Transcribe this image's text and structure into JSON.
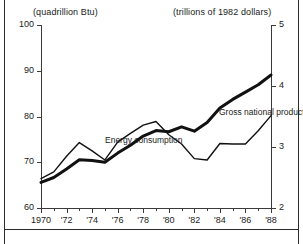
{
  "chart_data": {
    "type": "line",
    "title": "",
    "xlabel": "",
    "grid": false,
    "legend_position": "inline-annotations",
    "x": [
      1970,
      1971,
      1972,
      1973,
      1974,
      1975,
      1976,
      1977,
      1978,
      1979,
      1980,
      1981,
      1982,
      1983,
      1984,
      1985,
      1986,
      1987,
      1988
    ],
    "x_tick_labels": [
      "1970",
      "'72",
      "'74",
      "'76",
      "'78",
      "'80",
      "'82",
      "'84",
      "'86",
      "'88"
    ],
    "x_tick_values": [
      1970,
      1972,
      1974,
      1976,
      1978,
      1980,
      1982,
      1984,
      1986,
      1988
    ],
    "xlim": [
      1970,
      1988
    ],
    "axes": [
      {
        "side": "left",
        "unit_caption": "(quadrillion Btu)",
        "ylabel": "",
        "ylim": [
          60,
          100
        ],
        "ticks": [
          100,
          90,
          80,
          70,
          60
        ],
        "tick_labels": [
          "100",
          "90",
          "80",
          "70",
          "60"
        ]
      },
      {
        "side": "right",
        "unit_caption": "(trillions of 1982 dollars)",
        "ylabel": "",
        "ylim": [
          2,
          5
        ],
        "ticks": [
          5,
          4,
          3,
          2
        ],
        "tick_labels": [
          "5",
          "4",
          "3",
          "2"
        ]
      }
    ],
    "series": [
      {
        "name": "Energy consumption",
        "axis": "left",
        "unit": "quadrillion Btu",
        "style": "thin",
        "annotation": "Energy consumption",
        "values": [
          66.4,
          67.9,
          71.3,
          74.3,
          72.5,
          70.5,
          74.4,
          76.3,
          78.1,
          78.9,
          76.0,
          74.0,
          70.8,
          70.5,
          74.1,
          74.0,
          74.0,
          76.9,
          80.2
        ]
      },
      {
        "name": "Gross national product",
        "axis": "right",
        "unit": "trillions of 1982 dollars",
        "style": "thick",
        "annotation": "Gross national product",
        "values": [
          2.42,
          2.5,
          2.64,
          2.79,
          2.78,
          2.75,
          2.9,
          3.03,
          3.18,
          3.27,
          3.25,
          3.33,
          3.26,
          3.4,
          3.64,
          3.78,
          3.9,
          4.02,
          4.18
        ]
      }
    ]
  },
  "annotations": {
    "energy_label": "Energy consumption",
    "gnp_label": "Gross national product"
  },
  "colors": {
    "axis": "#3a3a3a",
    "frame": "#2b2b2b",
    "line": "#111111",
    "text": "#1a1a1a",
    "background": "#ffffff"
  }
}
